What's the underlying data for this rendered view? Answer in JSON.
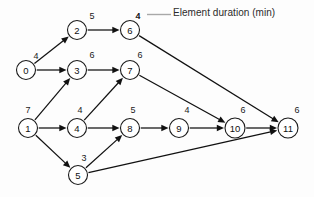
{
  "diagram": {
    "legend": {
      "label": "Element duration (min)",
      "anchor_duration": "4",
      "leader_color": "#a8a8a8"
    },
    "colors": {
      "node_stroke": "#1a1a1a",
      "node_fill": "#ffffff",
      "edge": "#111111",
      "text": "#111111",
      "background": "#fdfdfd"
    },
    "nodes": [
      {
        "id": "0",
        "label": "0",
        "duration": "4",
        "x": 26,
        "y": 70,
        "r": 9.5,
        "dur_x": 36,
        "dur_y": 59
      },
      {
        "id": "1",
        "label": "1",
        "duration": "7",
        "x": 28,
        "y": 128,
        "r": 9.5,
        "dur_x": 28,
        "dur_y": 113
      },
      {
        "id": "2",
        "label": "2",
        "duration": "5",
        "x": 77,
        "y": 30,
        "r": 9.5,
        "dur_x": 92,
        "dur_y": 19
      },
      {
        "id": "3",
        "label": "3",
        "duration": "6",
        "x": 77,
        "y": 70,
        "r": 9.5,
        "dur_x": 92,
        "dur_y": 58
      },
      {
        "id": "4",
        "label": "4",
        "duration": "4",
        "x": 77,
        "y": 128,
        "r": 9.5,
        "dur_x": 80,
        "dur_y": 113
      },
      {
        "id": "5",
        "label": "5",
        "duration": "3",
        "x": 78,
        "y": 175,
        "r": 9.5,
        "dur_x": 84,
        "dur_y": 161
      },
      {
        "id": "6",
        "label": "6",
        "duration": "4",
        "x": 130,
        "y": 30,
        "r": 9.5,
        "dur_x": 138,
        "dur_y": 19
      },
      {
        "id": "7",
        "label": "7",
        "duration": "6",
        "x": 130,
        "y": 70,
        "r": 9.5,
        "dur_x": 140,
        "dur_y": 58
      },
      {
        "id": "8",
        "label": "8",
        "duration": "5",
        "x": 130,
        "y": 128,
        "r": 9.5,
        "dur_x": 133,
        "dur_y": 113
      },
      {
        "id": "9",
        "label": "9",
        "duration": "4",
        "x": 179,
        "y": 128,
        "r": 9.5,
        "dur_x": 187,
        "dur_y": 113
      },
      {
        "id": "10",
        "label": "10",
        "duration": "6",
        "x": 235,
        "y": 128,
        "r": 10,
        "dur_x": 243,
        "dur_y": 113
      },
      {
        "id": "11",
        "label": "11",
        "duration": "6",
        "x": 288,
        "y": 128,
        "r": 10,
        "dur_x": 297,
        "dur_y": 113
      }
    ],
    "edges": [
      {
        "from": "0",
        "to": "2"
      },
      {
        "from": "0",
        "to": "3"
      },
      {
        "from": "1",
        "to": "3"
      },
      {
        "from": "1",
        "to": "4"
      },
      {
        "from": "1",
        "to": "5"
      },
      {
        "from": "2",
        "to": "6"
      },
      {
        "from": "3",
        "to": "7"
      },
      {
        "from": "4",
        "to": "7"
      },
      {
        "from": "4",
        "to": "8"
      },
      {
        "from": "5",
        "to": "8"
      },
      {
        "from": "5",
        "to": "11"
      },
      {
        "from": "6",
        "to": "11"
      },
      {
        "from": "7",
        "to": "10"
      },
      {
        "from": "8",
        "to": "9"
      },
      {
        "from": "9",
        "to": "10"
      },
      {
        "from": "10",
        "to": "11"
      }
    ]
  }
}
